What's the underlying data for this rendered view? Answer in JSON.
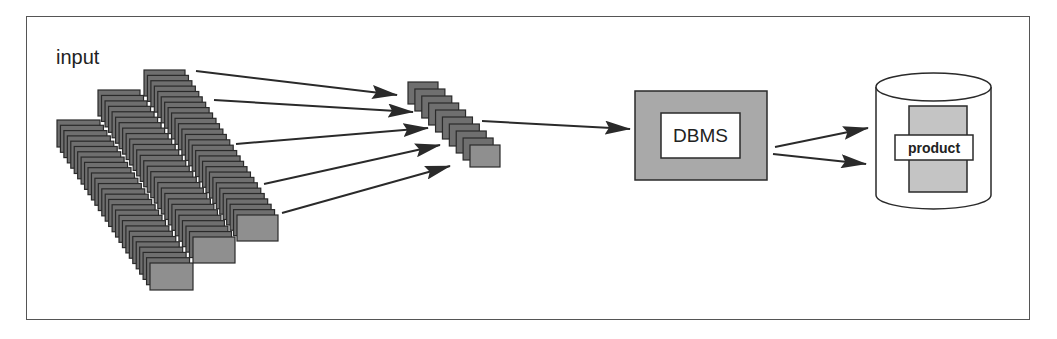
{
  "diagram": {
    "labels": {
      "input": "input",
      "dbms": "DBMS",
      "product": "product"
    },
    "colors": {
      "card_fill": "#6f6f6f",
      "card_front_fill": "#8f8f8f",
      "card_border": "#2a2a2a",
      "dbms_fill": "#a9a9a9",
      "product_fill": "#c4c4c4",
      "arrow": "#2a2a2a",
      "frame": "#555555"
    },
    "nodes": [
      {
        "id": "input-stacks",
        "label": "input",
        "type": "stacked-cards",
        "stacks": 3
      },
      {
        "id": "intermediate-stack",
        "type": "stacked-cards",
        "stacks": 1
      },
      {
        "id": "dbms",
        "label": "DBMS",
        "type": "box"
      },
      {
        "id": "database",
        "label": "product",
        "type": "cylinder"
      }
    ],
    "edges": [
      {
        "from": "input-stacks",
        "to": "intermediate-stack",
        "count": 5
      },
      {
        "from": "intermediate-stack",
        "to": "dbms",
        "count": 1
      },
      {
        "from": "dbms",
        "to": "database",
        "count": 2
      }
    ]
  }
}
